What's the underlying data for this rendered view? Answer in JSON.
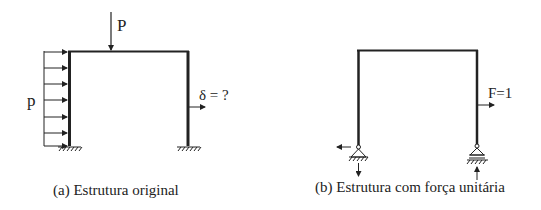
{
  "figure_a": {
    "caption": "(a) Estrutura original",
    "point_load_label": "P",
    "distributed_load_label": "p",
    "displacement_label": "δ = ?"
  },
  "figure_b": {
    "caption": "(b) Estrutura com força unitária",
    "unit_force_label": "F=1"
  },
  "colors": {
    "stroke": "#222222",
    "background": "#ffffff"
  }
}
